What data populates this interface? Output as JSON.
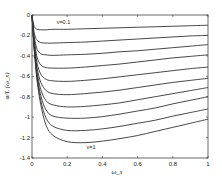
{
  "chart_data": {
    "type": "line",
    "title": "",
    "xlabel": "ω_s",
    "ylabel": "φ/L (ω_s)",
    "xlim": [
      0,
      1
    ],
    "ylim": [
      -1.4,
      0
    ],
    "xticks": [
      0,
      0.2,
      0.4,
      0.6,
      0.8,
      1
    ],
    "xtick_labels": [
      "0",
      "0.2",
      "0.4",
      "0.6",
      "0.8",
      "1"
    ],
    "yticks": [
      0,
      -0.2,
      -0.4,
      -0.6,
      -0.8,
      -1,
      -1.2,
      -1.4
    ],
    "ytick_labels": [
      "0",
      "-0.2",
      "-0.4",
      "-0.6",
      "-0.8",
      "-1",
      "-1.2",
      "-1.4"
    ],
    "grid": false,
    "legend": "none",
    "annotations": [
      {
        "text": "ν=0.1",
        "x": 0.14,
        "y": -0.09
      },
      {
        "text": "ν=1",
        "x": 0.31,
        "y": -1.31
      }
    ],
    "x": [
      0,
      0.01,
      0.02,
      0.03,
      0.05,
      0.08,
      0.12,
      0.2,
      0.3,
      0.4,
      0.5,
      0.6,
      0.7,
      0.8,
      0.9,
      1.0
    ],
    "series": [
      {
        "name": "ν=0.1",
        "values": [
          0,
          -0.1,
          -0.13,
          -0.14,
          -0.145,
          -0.145,
          -0.14,
          -0.14,
          -0.135,
          -0.13,
          -0.125,
          -0.12,
          -0.115,
          -0.11,
          -0.105,
          -0.1
        ]
      },
      {
        "name": "ν=0.2",
        "values": [
          0,
          -0.15,
          -0.22,
          -0.25,
          -0.27,
          -0.275,
          -0.275,
          -0.27,
          -0.265,
          -0.255,
          -0.245,
          -0.235,
          -0.225,
          -0.215,
          -0.205,
          -0.2
        ]
      },
      {
        "name": "ν=0.3",
        "values": [
          0,
          -0.18,
          -0.28,
          -0.34,
          -0.38,
          -0.39,
          -0.395,
          -0.39,
          -0.385,
          -0.375,
          -0.36,
          -0.35,
          -0.335,
          -0.32,
          -0.305,
          -0.29
        ]
      },
      {
        "name": "ν=0.4",
        "values": [
          0,
          -0.2,
          -0.33,
          -0.42,
          -0.49,
          -0.515,
          -0.52,
          -0.52,
          -0.51,
          -0.495,
          -0.48,
          -0.46,
          -0.44,
          -0.42,
          -0.405,
          -0.39
        ]
      },
      {
        "name": "ν=0.5",
        "values": [
          0,
          -0.22,
          -0.37,
          -0.48,
          -0.58,
          -0.63,
          -0.645,
          -0.65,
          -0.64,
          -0.625,
          -0.605,
          -0.585,
          -0.565,
          -0.545,
          -0.525,
          -0.51
        ]
      },
      {
        "name": "ν=0.6",
        "values": [
          0,
          -0.24,
          -0.4,
          -0.53,
          -0.66,
          -0.74,
          -0.77,
          -0.78,
          -0.77,
          -0.755,
          -0.735,
          -0.71,
          -0.685,
          -0.66,
          -0.64,
          -0.62
        ]
      },
      {
        "name": "ν=0.7",
        "values": [
          0,
          -0.25,
          -0.43,
          -0.57,
          -0.73,
          -0.84,
          -0.88,
          -0.9,
          -0.895,
          -0.88,
          -0.86,
          -0.83,
          -0.8,
          -0.77,
          -0.74,
          -0.71
        ]
      },
      {
        "name": "ν=0.8",
        "values": [
          0,
          -0.26,
          -0.45,
          -0.6,
          -0.79,
          -0.93,
          -0.99,
          -1.01,
          -1.01,
          -0.995,
          -0.97,
          -0.94,
          -0.91,
          -0.87,
          -0.835,
          -0.8
        ]
      },
      {
        "name": "ν=0.9",
        "values": [
          0,
          -0.27,
          -0.47,
          -0.63,
          -0.84,
          -1.01,
          -1.09,
          -1.13,
          -1.13,
          -1.115,
          -1.09,
          -1.06,
          -1.03,
          -0.99,
          -0.955,
          -0.92
        ]
      },
      {
        "name": "ν=1",
        "values": [
          0,
          -0.28,
          -0.49,
          -0.66,
          -0.88,
          -1.08,
          -1.18,
          -1.24,
          -1.25,
          -1.235,
          -1.21,
          -1.18,
          -1.14,
          -1.1,
          -1.06,
          -1.02
        ]
      }
    ],
    "colors": {
      "line": "#333333",
      "axes": "#444444",
      "background": "#ffffff"
    }
  }
}
